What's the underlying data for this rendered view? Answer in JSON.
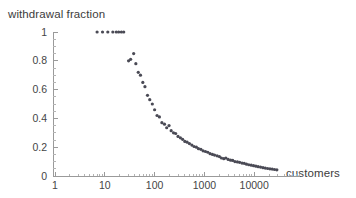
{
  "chart_data": {
    "type": "scatter",
    "title": "",
    "xlabel": "customers",
    "ylabel": "withdrawal fraction",
    "xscale": "log",
    "yscale": "linear",
    "xlim": [
      1,
      40000
    ],
    "ylim": [
      0,
      1
    ],
    "grid": false,
    "legend": null,
    "xticks": [
      1,
      10,
      100,
      1000,
      10000
    ],
    "xticklabels": [
      "1",
      "10",
      "100",
      "1000",
      "10000"
    ],
    "yticks": [
      0,
      0.2,
      0.4,
      0.6,
      0.8,
      1
    ],
    "yticklabels": [
      "0",
      "0.2",
      "0.4",
      "0.6",
      "0.8",
      "1"
    ],
    "marker": "point",
    "marker_color": "#4a4a55",
    "marker_size": 1.6,
    "points": [
      {
        "x": 7.0,
        "y": 1.0
      },
      {
        "x": 9.0,
        "y": 1.0
      },
      {
        "x": 11.5,
        "y": 1.0
      },
      {
        "x": 14.5,
        "y": 1.0
      },
      {
        "x": 17.0,
        "y": 1.0
      },
      {
        "x": 19.0,
        "y": 1.0
      },
      {
        "x": 21.5,
        "y": 1.0
      },
      {
        "x": 24.0,
        "y": 1.0
      },
      {
        "x": 30.0,
        "y": 0.8
      },
      {
        "x": 33.0,
        "y": 0.81
      },
      {
        "x": 38.0,
        "y": 0.85
      },
      {
        "x": 42.0,
        "y": 0.78
      },
      {
        "x": 47.0,
        "y": 0.72
      },
      {
        "x": 52.0,
        "y": 0.7
      },
      {
        "x": 58.0,
        "y": 0.65
      },
      {
        "x": 64.0,
        "y": 0.62
      },
      {
        "x": 72.0,
        "y": 0.56
      },
      {
        "x": 80.0,
        "y": 0.53
      },
      {
        "x": 90.0,
        "y": 0.5
      },
      {
        "x": 100.0,
        "y": 0.46
      },
      {
        "x": 112.0,
        "y": 0.42
      },
      {
        "x": 125.0,
        "y": 0.41
      },
      {
        "x": 140.0,
        "y": 0.37
      },
      {
        "x": 158.0,
        "y": 0.36
      },
      {
        "x": 175.0,
        "y": 0.335
      },
      {
        "x": 195.0,
        "y": 0.35
      },
      {
        "x": 215.0,
        "y": 0.315
      },
      {
        "x": 240.0,
        "y": 0.3
      },
      {
        "x": 265.0,
        "y": 0.295
      },
      {
        "x": 295.0,
        "y": 0.275
      },
      {
        "x": 330.0,
        "y": 0.265
      },
      {
        "x": 365.0,
        "y": 0.255
      },
      {
        "x": 405.0,
        "y": 0.24
      },
      {
        "x": 450.0,
        "y": 0.235
      },
      {
        "x": 500.0,
        "y": 0.225
      },
      {
        "x": 560.0,
        "y": 0.215
      },
      {
        "x": 620.0,
        "y": 0.205
      },
      {
        "x": 690.0,
        "y": 0.2
      },
      {
        "x": 760.0,
        "y": 0.19
      },
      {
        "x": 850.0,
        "y": 0.185
      },
      {
        "x": 940.0,
        "y": 0.175
      },
      {
        "x": 1050.0,
        "y": 0.17
      },
      {
        "x": 1170.0,
        "y": 0.165
      },
      {
        "x": 1300.0,
        "y": 0.155
      },
      {
        "x": 1450.0,
        "y": 0.15
      },
      {
        "x": 1600.0,
        "y": 0.145
      },
      {
        "x": 1800.0,
        "y": 0.14
      },
      {
        "x": 2000.0,
        "y": 0.135
      },
      {
        "x": 2200.0,
        "y": 0.125
      },
      {
        "x": 2450.0,
        "y": 0.12
      },
      {
        "x": 2700.0,
        "y": 0.125
      },
      {
        "x": 3000.0,
        "y": 0.115
      },
      {
        "x": 3350.0,
        "y": 0.11
      },
      {
        "x": 3700.0,
        "y": 0.108
      },
      {
        "x": 4100.0,
        "y": 0.1
      },
      {
        "x": 4600.0,
        "y": 0.098
      },
      {
        "x": 5100.0,
        "y": 0.095
      },
      {
        "x": 5700.0,
        "y": 0.09
      },
      {
        "x": 6300.0,
        "y": 0.088
      },
      {
        "x": 7000.0,
        "y": 0.082
      },
      {
        "x": 7800.0,
        "y": 0.078
      },
      {
        "x": 8700.0,
        "y": 0.075
      },
      {
        "x": 9700.0,
        "y": 0.072
      },
      {
        "x": 10800.0,
        "y": 0.068
      },
      {
        "x": 12000.0,
        "y": 0.065
      },
      {
        "x": 13400.0,
        "y": 0.062
      },
      {
        "x": 15000.0,
        "y": 0.058
      },
      {
        "x": 16700.0,
        "y": 0.055
      },
      {
        "x": 18600.0,
        "y": 0.052
      },
      {
        "x": 20700.0,
        "y": 0.05
      },
      {
        "x": 23000.0,
        "y": 0.048
      },
      {
        "x": 25600.0,
        "y": 0.045
      },
      {
        "x": 28500.0,
        "y": 0.043
      }
    ]
  },
  "axes": {
    "geometry": {
      "origin_x_px": 53,
      "origin_y_px": 176,
      "x_axis_end_px": 300,
      "y_axis_top_px": 32,
      "px_per_decade": 49.8,
      "x_decade1_px": 55,
      "y_value1_px": 32,
      "y_value0_px": 176
    }
  }
}
